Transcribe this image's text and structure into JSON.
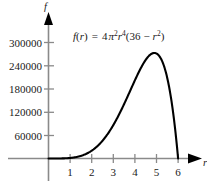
{
  "chart_data": {
    "type": "line",
    "title": "",
    "annotation": "f(r) = 4π²r⁴(36 − r²)",
    "formula_parts": {
      "fn": "f",
      "open": "(",
      "var": "r",
      "close": ")",
      "equals": "=",
      "coef": "4",
      "pi": "π",
      "pi_exp": "2",
      "r1": "r",
      "r1_exp": "4",
      "paren_open": "(",
      "const": "36",
      "minus": "−",
      "r2": "r",
      "r2_exp": "2",
      "paren_close": ")"
    },
    "xlabel": "r",
    "ylabel": "f",
    "xticks": [
      1,
      2,
      3,
      4,
      5,
      6
    ],
    "xtick_labels": [
      "1",
      "2",
      "3",
      "4",
      "5",
      "6"
    ],
    "yticks": [
      60000,
      120000,
      180000,
      240000,
      300000
    ],
    "ytick_labels": [
      "60000",
      "120000",
      "180000",
      "240000",
      "300000"
    ],
    "xlim": [
      -0.55,
      6.9
    ],
    "ylim": [
      -22000,
      330000
    ],
    "grid": false,
    "legend": null,
    "curve_color": "#000000",
    "axis_color": "#8a8a8a",
    "text_color": "#1a1a1a",
    "background": "#ffffff",
    "domain": [
      0,
      6
    ],
    "peak": {
      "x": 4.899,
      "y": 272958
    },
    "points": [
      {
        "x": 0.0,
        "y": 0
      },
      {
        "x": 0.25,
        "y": 2216
      },
      {
        "x": 0.5,
        "y": 8838
      },
      {
        "x": 0.75,
        "y": 44360
      },
      {
        "x": 1.0,
        "y": 138174
      },
      {
        "x": 1.25,
        "y": 330297
      },
      {
        "x": 1.5,
        "y": 665652
      },
      {
        "x": 1.75,
        "y": 1188000
      },
      {
        "x": 2.0,
        "y": 2021555
      },
      {
        "x": 2.25,
        "y": 3190000
      },
      {
        "x": 2.5,
        "y": 4821000
      },
      {
        "x": 2.75,
        "y": 6980000
      },
      {
        "x": 3.0,
        "y": 9709000
      },
      {
        "x": 3.25,
        "y": 13010000
      },
      {
        "x": 3.5,
        "y": 16820000
      },
      {
        "x": 3.75,
        "y": 21000000
      },
      {
        "x": 4.0,
        "y": 25290000
      },
      {
        "x": 4.25,
        "y": 29330000
      },
      {
        "x": 4.5,
        "y": 32640000
      },
      {
        "x": 4.75,
        "y": 34640000
      },
      {
        "x": 5.0,
        "y": 34700000
      },
      {
        "x": 5.25,
        "y": 32200000
      },
      {
        "x": 5.5,
        "y": 26550000
      },
      {
        "x": 5.75,
        "y": 17280000
      },
      {
        "x": 6.0,
        "y": 0
      }
    ],
    "note": "curve values plotted on the figure are scaled so the maximum near r=5 reaches about 272958"
  }
}
